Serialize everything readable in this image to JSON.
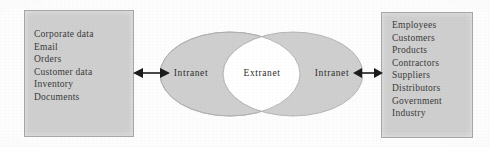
{
  "diagram": {
    "left_box": {
      "name": "internal-data-box",
      "items": [
        "Corporate data",
        "Email",
        "Orders",
        "Customer data",
        "Inventory",
        "Documents"
      ]
    },
    "right_box": {
      "name": "external-parties-box",
      "items": [
        "Employees",
        "Customers",
        "Products",
        "Contractors",
        "Suppliers",
        "Distributors",
        "Government",
        "Industry"
      ]
    },
    "venn": {
      "left_ellipse_label": "Intranet",
      "overlap_label": "Extranet",
      "right_ellipse_label": "Intranet"
    },
    "connectors": {
      "left_arrow": "double-headed-arrow",
      "right_arrow": "double-headed-arrow"
    },
    "colors": {
      "box_fill": "#cfcfcf",
      "box_border": "#a8a8a8",
      "ellipse_fill": "#cfcfcf",
      "ellipse_stroke": "#b4b4b4",
      "overlap_fill": "#ffffff",
      "text": "#3a3a3a",
      "background": "#fdfdfd"
    }
  }
}
